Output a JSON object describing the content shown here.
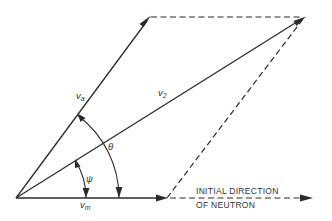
{
  "figure": {
    "type": "vector-parallelogram",
    "colors": {
      "line": "#2b2b2b",
      "text": "#333333",
      "background": "#ffffff"
    },
    "labels": {
      "va": {
        "main": "v",
        "sub": "a"
      },
      "v2": {
        "main": "v",
        "sub": "2"
      },
      "vm": {
        "main": "v",
        "sub": "m"
      },
      "theta": "θ",
      "psi": "ψ"
    },
    "caption": {
      "line1": "INITIAL DIRECTION",
      "line2": "OF NEUTRON"
    }
  }
}
